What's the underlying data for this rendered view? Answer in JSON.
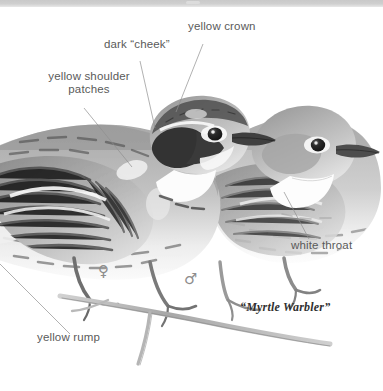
{
  "plate": {
    "width": 383,
    "height": 391,
    "background_color": "#ffffff",
    "top_band_color": "#cbcbcb",
    "media": "graphite pencil illustration",
    "subject": "two warblers perched on a thin branch, facing right"
  },
  "caption": {
    "text": "“Myrtle Warbler”",
    "x": 240,
    "y": 307
  },
  "annotations": [
    {
      "id": "yellow-crown",
      "text": "yellow crown",
      "lines": [
        "yellow crown"
      ],
      "x": 188,
      "y": 26,
      "leader": {
        "x1": 203,
        "y1": 44,
        "x2": 176,
        "y2": 112
      }
    },
    {
      "id": "dark-cheek",
      "text": "dark “cheek”",
      "lines": [
        "dark “cheek”"
      ],
      "x": 104,
      "y": 44,
      "leader": {
        "x1": 140,
        "y1": 61,
        "x2": 155,
        "y2": 128
      }
    },
    {
      "id": "yellow-shoulder-patches",
      "text": "yellow shoulder patches",
      "lines": [
        "yellow shoulder",
        "patches"
      ],
      "x": 38,
      "y": 76,
      "leader": {
        "x1": 84,
        "y1": 108,
        "x2": 132,
        "y2": 167
      }
    },
    {
      "id": "white-throat",
      "text": "white throat",
      "lines": [
        "white throat"
      ],
      "x": 292,
      "y": 243,
      "leader": {
        "x1": 309,
        "y1": 239,
        "x2": 284,
        "y2": 192
      }
    },
    {
      "id": "yellow-rump",
      "text": "yellow rump",
      "lines": [
        "yellow rump"
      ],
      "x": 38,
      "y": 337,
      "leader": {
        "x1": 70,
        "y1": 334,
        "x2": 0,
        "y2": 264
      }
    }
  ],
  "sex_symbols": [
    {
      "id": "female",
      "glyph": "♀",
      "x": 101,
      "y": 265,
      "meaning": "female"
    },
    {
      "id": "male",
      "glyph": "♂",
      "x": 187,
      "y": 273,
      "meaning": "male"
    }
  ],
  "birds": [
    {
      "id": "male-bird",
      "sex": "male",
      "position": "foreground left",
      "features": [
        "yellow crown",
        "dark cheek",
        "yellow shoulder patches",
        "yellow rump",
        "streaked flanks",
        "white eye arcs"
      ]
    },
    {
      "id": "female-bird",
      "sex": "female",
      "position": "background right",
      "features": [
        "plain grayish-brown head",
        "white eye-ring",
        "white throat",
        "streaked breast"
      ]
    }
  ],
  "colors": {
    "label_text": "#5a5a5a",
    "caption_text": "#2f2f2f",
    "leader_line": "#8f8f8f",
    "plumage_dark": "#3b3b3b",
    "plumage_mid": "#8a8a8a",
    "plumage_light": "#d4d4d4",
    "branch": "#b4b4b4"
  }
}
